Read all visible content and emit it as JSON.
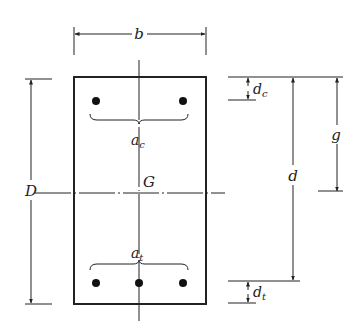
{
  "diagram": {
    "labels": {
      "width": "b",
      "total_depth": "D",
      "centroid": "G",
      "effective_depth": "d",
      "centroid_distance": "g",
      "compression_cover": "d",
      "compression_cover_sub": "c",
      "tension_cover": "d",
      "tension_cover_sub": "t",
      "compression_area": "a",
      "compression_area_sub": "c",
      "tension_area": "a",
      "tension_area_sub": "t"
    },
    "bars": {
      "compression_count": 2,
      "tension_count": 3
    },
    "colors": {
      "line": "#222222",
      "background": "#ffffff"
    }
  }
}
